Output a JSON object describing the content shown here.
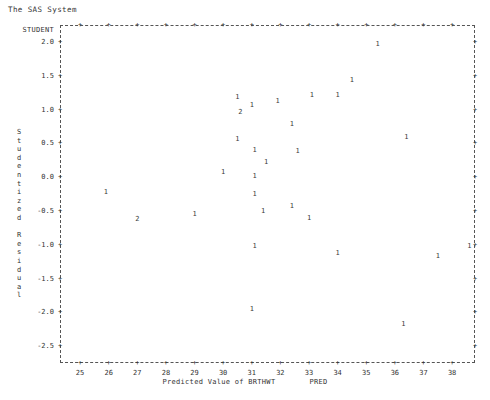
{
  "window": {
    "title": "The SAS System"
  },
  "plot": {
    "y_axis": {
      "header_label": "STUDENT",
      "title_text": "Studentized Residual",
      "ticks": [
        "2.0",
        "1.5",
        "1.0",
        "0.5",
        "0.0",
        "-0.5",
        "-1.0",
        "-1.5",
        "-2.0",
        "-2.5"
      ],
      "tick_values": [
        2.0,
        1.5,
        1.0,
        0.5,
        0.0,
        -0.5,
        -1.0,
        -1.5,
        -2.0,
        -2.5
      ],
      "tick_glyph": "+"
    },
    "x_axis": {
      "title_text": "Predicted Value of BRTHWT",
      "title_suffix": "PRED",
      "ticks": [
        "25",
        "26",
        "27",
        "28",
        "29",
        "30",
        "31",
        "32",
        "33",
        "34",
        "35",
        "36",
        "37",
        "38"
      ],
      "tick_values": [
        25,
        26,
        27,
        28,
        29,
        30,
        31,
        32,
        33,
        34,
        35,
        36,
        37,
        38
      ],
      "tick_glyph": "+"
    },
    "border_style": "dashed",
    "colors": {
      "background": "#ffffff",
      "axis": "#555555",
      "text": "#333333",
      "marker": "#3a3a3a"
    }
  },
  "chart_data": {
    "type": "scatter",
    "title": "The SAS System",
    "xlabel": "Predicted Value of BRTHWT   PRED",
    "ylabel": "Studentized Residual",
    "xlim": [
      24.3,
      38.8
    ],
    "ylim": [
      -2.75,
      2.25
    ],
    "grid": false,
    "legend": null,
    "marker_meaning": "digit indicates number of overlapping observations at that location",
    "points": [
      {
        "x": 35.4,
        "y": 1.97,
        "label": "1"
      },
      {
        "x": 34.5,
        "y": 1.43,
        "label": "1"
      },
      {
        "x": 33.1,
        "y": 1.22,
        "label": "1"
      },
      {
        "x": 34.0,
        "y": 1.21,
        "label": "1"
      },
      {
        "x": 30.5,
        "y": 1.18,
        "label": "1"
      },
      {
        "x": 31.9,
        "y": 1.13,
        "label": "1"
      },
      {
        "x": 31.0,
        "y": 1.06,
        "label": "1"
      },
      {
        "x": 30.6,
        "y": 0.96,
        "label": "2"
      },
      {
        "x": 32.4,
        "y": 0.78,
        "label": "1"
      },
      {
        "x": 36.4,
        "y": 0.6,
        "label": "1"
      },
      {
        "x": 30.5,
        "y": 0.56,
        "label": "1"
      },
      {
        "x": 31.1,
        "y": 0.4,
        "label": "1"
      },
      {
        "x": 32.6,
        "y": 0.38,
        "label": "1"
      },
      {
        "x": 31.5,
        "y": 0.22,
        "label": "1"
      },
      {
        "x": 30.0,
        "y": 0.08,
        "label": "1"
      },
      {
        "x": 31.1,
        "y": 0.02,
        "label": "1"
      },
      {
        "x": 25.9,
        "y": -0.22,
        "label": "1"
      },
      {
        "x": 31.1,
        "y": -0.25,
        "label": "1"
      },
      {
        "x": 32.4,
        "y": -0.43,
        "label": "1"
      },
      {
        "x": 31.4,
        "y": -0.5,
        "label": "1"
      },
      {
        "x": 29.0,
        "y": -0.55,
        "label": "1"
      },
      {
        "x": 33.0,
        "y": -0.6,
        "label": "1"
      },
      {
        "x": 27.0,
        "y": -0.62,
        "label": "2"
      },
      {
        "x": 31.1,
        "y": -1.02,
        "label": "1"
      },
      {
        "x": 34.0,
        "y": -1.12,
        "label": "1"
      },
      {
        "x": 37.5,
        "y": -1.16,
        "label": "1"
      },
      {
        "x": 38.6,
        "y": -1.02,
        "label": "1"
      },
      {
        "x": 31.0,
        "y": -1.95,
        "label": "1"
      },
      {
        "x": 36.3,
        "y": -2.18,
        "label": "1"
      }
    ]
  }
}
